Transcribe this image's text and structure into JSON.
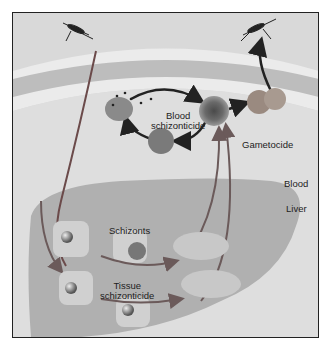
{
  "diagram": {
    "colors": {
      "background": "#d9d9d9",
      "skin_band": "#bdbdbd",
      "skin_light": "#ebebeb",
      "liver": "#b2b2b2",
      "blood": "#dcdcdc",
      "arrow_red": "#7a6060",
      "arrow_dark": "#222222"
    },
    "labels": {
      "blood_schizonticide_line1": "Blood",
      "blood_schizonticide_line2": "schizonticide",
      "gametocide": "Gametocide",
      "blood": "Blood",
      "liver": "Liver",
      "schizonts": "Schizonts",
      "tissue_schizonticide_line1": "Tissue",
      "tissue_schizonticide_line2": "schizonticide",
      "hypnozoites": "Hypnozoites"
    }
  }
}
